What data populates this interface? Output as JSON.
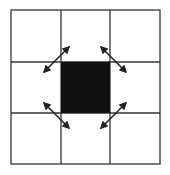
{
  "diagram": {
    "type": "3x3 grid with center cell and diagonal neighbor arrows",
    "grid": {
      "rows": 3,
      "cols": 3,
      "x0": 11,
      "y0": 10,
      "x1": 160,
      "y1": 164,
      "col_lines": [
        61,
        110
      ],
      "row_lines": [
        62,
        113
      ],
      "line_color": "#333333"
    },
    "center_cell": {
      "x": 61,
      "y": 62,
      "w": 49,
      "h": 51,
      "fill": "#111111"
    },
    "arrows": [
      {
        "name": "arrow-top-left",
        "x1": 69,
        "y1": 47,
        "x2": 44,
        "y2": 72
      },
      {
        "name": "arrow-top-right",
        "x1": 101,
        "y1": 47,
        "x2": 126,
        "y2": 72
      },
      {
        "name": "arrow-bottom-left",
        "x1": 44,
        "y1": 103,
        "x2": 69,
        "y2": 128
      },
      {
        "name": "arrow-bottom-right",
        "x1": 126,
        "y1": 103,
        "x2": 101,
        "y2": 128
      }
    ],
    "arrow_color": "#222222"
  }
}
